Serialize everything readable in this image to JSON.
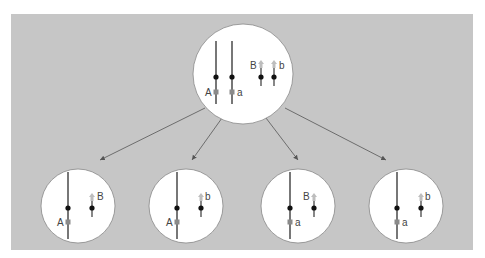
{
  "diagram": {
    "type": "meiosis-independent-assortment",
    "colors": {
      "background_panel": "#c6c6c6",
      "cell_fill": "#ffffff",
      "chromosome": "#555555",
      "centromere": "#111111",
      "gene_square": "#8a8a8a",
      "gene_arrow": "#bdbdbd",
      "arrow": "#555555"
    },
    "parent_cell": {
      "labels": {
        "A": "A",
        "a": "a",
        "B": "B",
        "b": "b"
      }
    },
    "gametes": [
      {
        "long_label": "A",
        "short_label": "B"
      },
      {
        "long_label": "A",
        "short_label": "b"
      },
      {
        "long_label": "a",
        "short_label": "B"
      },
      {
        "long_label": "a",
        "short_label": "b"
      }
    ]
  }
}
